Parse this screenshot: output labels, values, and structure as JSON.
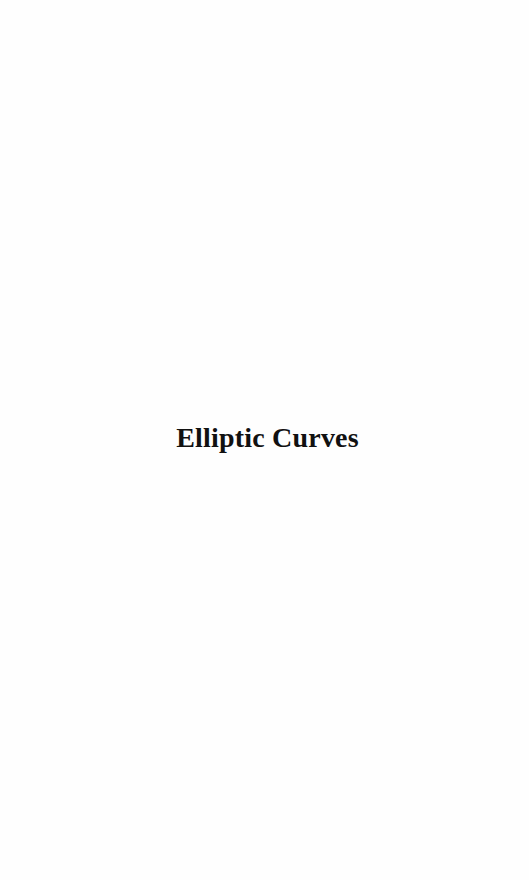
{
  "document": {
    "title": "Elliptic Curves"
  },
  "colors": {
    "background": "#fefefe",
    "text": "#111111"
  }
}
